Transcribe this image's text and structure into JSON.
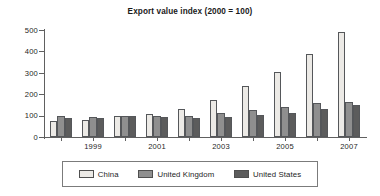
{
  "chart_data": {
    "type": "bar",
    "title": "Export value index (2000 = 100)",
    "xlabel": "",
    "ylabel": "",
    "ylim": [
      0,
      500
    ],
    "yticks": [
      0,
      100,
      200,
      300,
      400,
      500
    ],
    "ytick_labels": [
      "0",
      "100",
      "200",
      "300",
      "400",
      "500"
    ],
    "grid": false,
    "legend_position": "bottom",
    "categories": [
      "1998",
      "1999",
      "2000",
      "2001",
      "2002",
      "2003",
      "2004",
      "2005",
      "2006",
      "2007"
    ],
    "visible_xtick_labels": [
      "1999",
      "2001",
      "2003",
      "2005",
      "2007"
    ],
    "series": [
      {
        "name": "China",
        "color": "#eceae6",
        "values": [
          75,
          78,
          100,
          107,
          130,
          175,
          238,
          304,
          388,
          490
        ]
      },
      {
        "name": "United Kingdom",
        "color": "#8f8f8f",
        "values": [
          97,
          94,
          100,
          96,
          97,
          111,
          124,
          139,
          160,
          163
        ]
      },
      {
        "name": "United States",
        "color": "#5c5c5c",
        "values": [
          89,
          88,
          100,
          93,
          88,
          93,
          104,
          113,
          131,
          149
        ]
      }
    ]
  },
  "legend": {
    "items": [
      {
        "label": "China",
        "swatch": "legend-swatch-china"
      },
      {
        "label": "United Kingdom",
        "swatch": "legend-swatch-united-kingdom"
      },
      {
        "label": "United States",
        "swatch": "legend-swatch-united-states"
      }
    ]
  },
  "colors": {
    "china": "#eceae6",
    "united_kingdom": "#8f8f8f",
    "united_states": "#5c5c5c",
    "axis": "#606060",
    "text": "#1d1d1d",
    "background": "#ffffff"
  }
}
